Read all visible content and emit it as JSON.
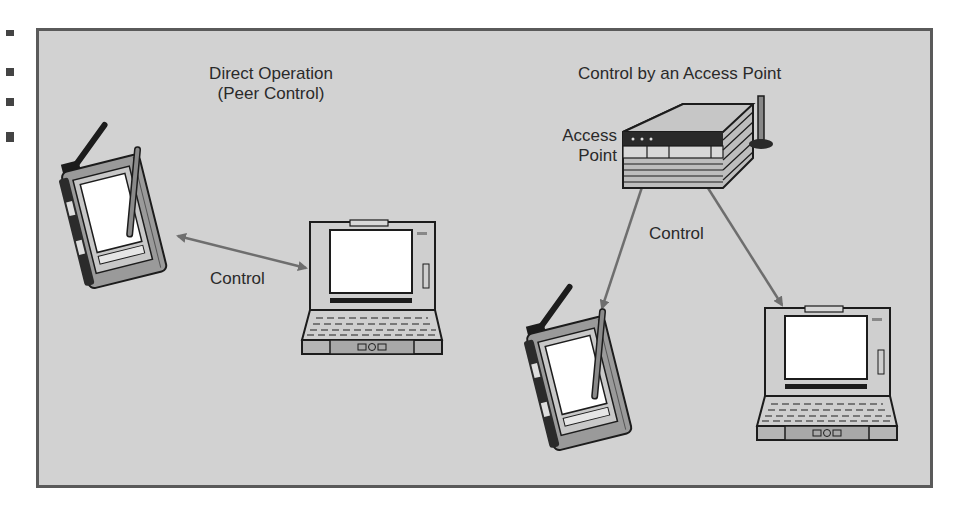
{
  "diagram": {
    "title_left": {
      "line1": "Direct Operation",
      "line2": "(Peer Control)"
    },
    "title_right": "Control by an Access Point",
    "access_point_label": {
      "line1": "Access",
      "line2": "Point"
    },
    "control_label_left": "Control",
    "control_label_right": "Control",
    "nodes": [
      {
        "id": "pda-left",
        "type": "pda-icon"
      },
      {
        "id": "laptop-left",
        "type": "laptop-icon"
      },
      {
        "id": "access-point",
        "type": "access-point-icon"
      },
      {
        "id": "pda-right",
        "type": "pda-icon"
      },
      {
        "id": "laptop-right",
        "type": "laptop-icon"
      }
    ],
    "edges": [
      {
        "from": "pda-left",
        "to": "laptop-left",
        "label": "Control",
        "direction": "bidirectional"
      },
      {
        "from": "access-point",
        "to": "pda-right",
        "label": "Control",
        "direction": "one-way"
      },
      {
        "from": "access-point",
        "to": "laptop-right",
        "label": "Control",
        "direction": "one-way"
      }
    ],
    "colors": {
      "background": "#d2d2d2",
      "frame_border": "#5a5a5a",
      "arrow": "#6e6e6e",
      "text": "#2a2a2a"
    }
  }
}
